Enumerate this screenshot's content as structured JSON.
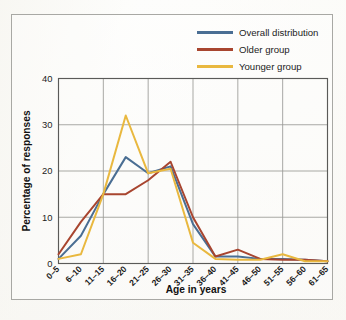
{
  "chart_data": {
    "type": "line",
    "title": "",
    "xlabel": "Age in years",
    "ylabel": "Percentage of responses",
    "categories": [
      "0–5",
      "6–10",
      "11–15",
      "16–20",
      "21–25",
      "26–30",
      "31–35",
      "36–40",
      "41–45",
      "46–50",
      "51–55",
      "56–60",
      "61–65"
    ],
    "ylim": [
      0,
      40
    ],
    "yticks": [
      0,
      10,
      20,
      30,
      40
    ],
    "ytick_labels": [
      "0",
      "10",
      "20",
      "30",
      "40"
    ],
    "grid": true,
    "grid_axis": "both",
    "legend_position": "top-right",
    "series": [
      {
        "name": "Overall distribution",
        "color": "#4a6e93",
        "values": [
          1,
          6,
          15,
          23,
          19.5,
          21,
          8.5,
          1.5,
          1.5,
          1,
          1,
          0.8,
          0.5
        ]
      },
      {
        "name": "Older group",
        "color": "#a8452f",
        "values": [
          2,
          9,
          15,
          15,
          18,
          22,
          10,
          1.5,
          3,
          1,
          0.8,
          0.8,
          0.5
        ]
      },
      {
        "name": "Younger group",
        "color": "#e9b83f",
        "values": [
          1,
          2,
          15,
          32,
          19.5,
          20.5,
          4.5,
          1,
          0.8,
          0.8,
          2,
          0.5,
          0.5
        ]
      }
    ]
  },
  "legend": {
    "entries": [
      {
        "label": "Overall distribution",
        "color": "#4a6e93"
      },
      {
        "label": "Older group",
        "color": "#a8452f"
      },
      {
        "label": "Younger group",
        "color": "#e9b83f"
      }
    ]
  },
  "axes": {
    "y_axis_title": "Percentage of responses",
    "x_axis_title": "Age in years"
  },
  "style": {
    "frame_color": "#a8a8a4",
    "grid_color": "#9a9a96",
    "axis_color": "#5a5a58",
    "text_color": "#1c1c1c",
    "paper_color": "#fbfbf9"
  }
}
